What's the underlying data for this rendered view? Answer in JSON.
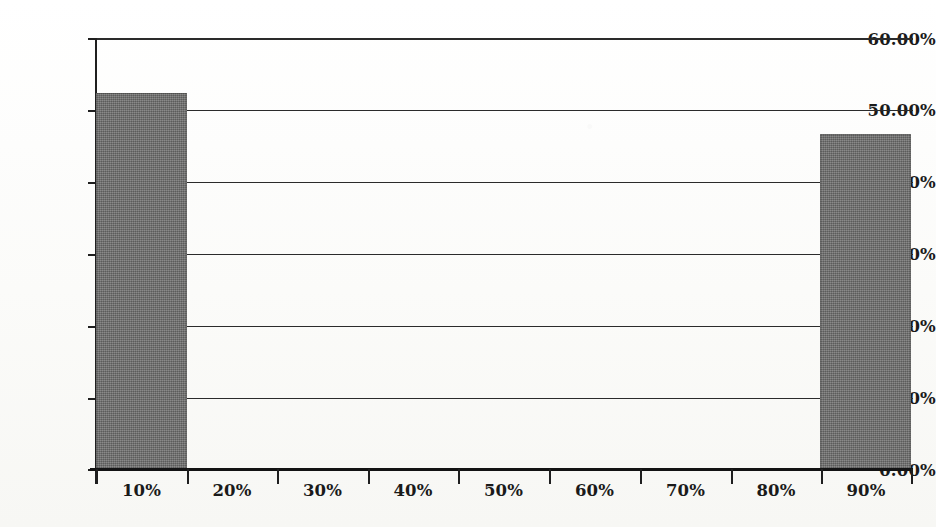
{
  "chart_data": {
    "type": "bar",
    "title": "",
    "subtitle": "",
    "xlabel": "",
    "ylabel": "",
    "categories": [
      "10%",
      "20%",
      "30%",
      "40%",
      "50%",
      "60%",
      "70%",
      "80%",
      "90%"
    ],
    "values": [
      52.3,
      0,
      0,
      0,
      0,
      0,
      0,
      0,
      46.6
    ],
    "value_labels": [
      "52.30%",
      "0.00%",
      "0.00%",
      "0.00%",
      "0.00%",
      "0.00%",
      "0.00%",
      "0.00%",
      "46.60%"
    ],
    "ylim": [
      0,
      60
    ],
    "y_ticks": [
      0,
      10,
      20,
      30,
      40,
      50,
      60
    ],
    "y_tick_labels": [
      "0.00%",
      "10.00%",
      "20.00%",
      "30.00%",
      "40.00%",
      "50.00%",
      "60.00%"
    ],
    "grid": true,
    "grid_axis": "y",
    "legend": false,
    "legend_position": "none",
    "bar_color": "#70706f",
    "axis_color": "#1f1f1f",
    "background_color": "#fdfdfb",
    "series": [
      {
        "name": "",
        "values": [
          52.3,
          0,
          0,
          0,
          0,
          0,
          0,
          0,
          46.6
        ]
      }
    ]
  },
  "axes": {
    "y_ticks": [
      {
        "label": "60.00%",
        "value": 60
      },
      {
        "label": "50.00%",
        "value": 50
      },
      {
        "label": "40.00%",
        "value": 40
      },
      {
        "label": "30.00%",
        "value": 30
      },
      {
        "label": "20.00%",
        "value": 20
      },
      {
        "label": "10.00%",
        "value": 10
      },
      {
        "label": "0.00%",
        "value": 0
      }
    ],
    "x_ticks": [
      {
        "label": "10%"
      },
      {
        "label": "20%"
      },
      {
        "label": "30%"
      },
      {
        "label": "40%"
      },
      {
        "label": "50%"
      },
      {
        "label": "60%"
      },
      {
        "label": "70%"
      },
      {
        "label": "80%"
      },
      {
        "label": "90%"
      }
    ]
  }
}
